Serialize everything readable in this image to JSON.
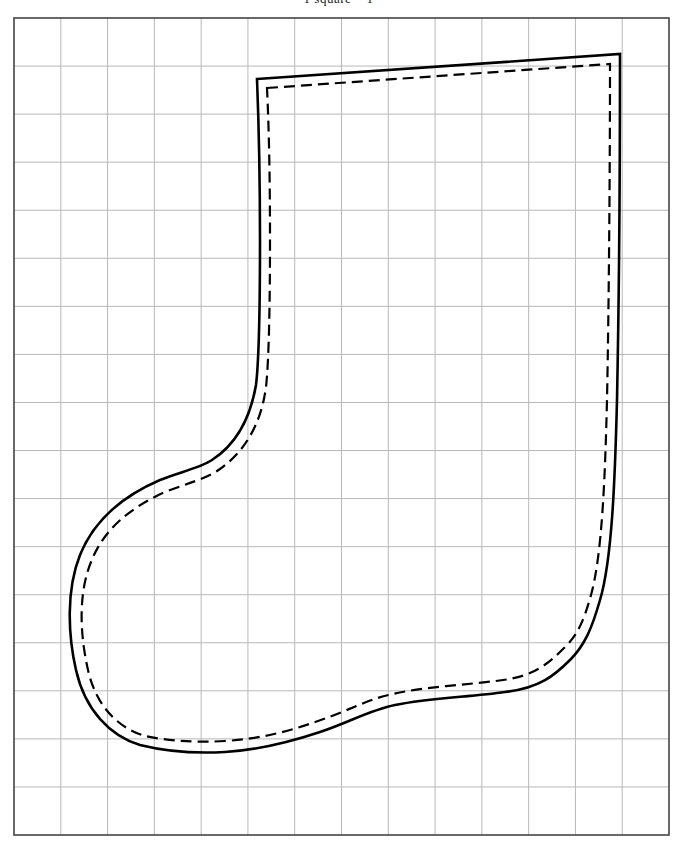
{
  "title": "1 square = 1\"",
  "pattern": {
    "name": "Christmas stocking template",
    "grid": {
      "columns": 14,
      "rows": 17,
      "left": 14,
      "top": 18,
      "right": 669,
      "bottom": 835,
      "line_color": "#b8b8b8",
      "border_color": "#444444"
    },
    "outline": {
      "cut_line": "solid",
      "stitch_line": "dashed",
      "color": "#000000"
    }
  }
}
